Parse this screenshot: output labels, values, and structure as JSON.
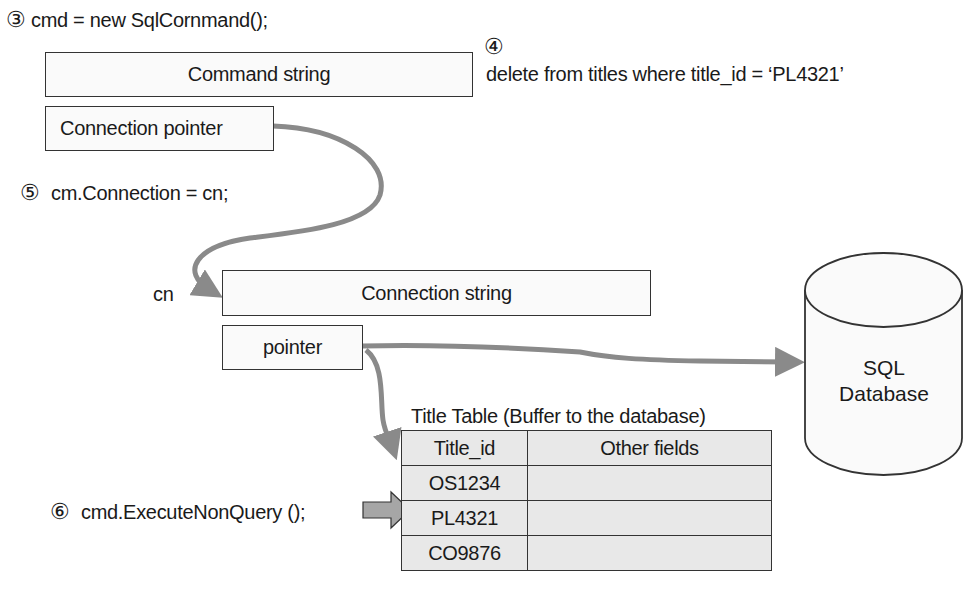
{
  "steps": {
    "step3": {
      "number": "③",
      "code": "cmd = new SqlCornmand();"
    },
    "step4": {
      "number": "④",
      "sql": "delete from titles where title_id = ‘PL4321’"
    },
    "step5": {
      "number": "⑤",
      "code": "cm.Connection = cn;"
    },
    "step6": {
      "number": "⑥",
      "code": "cmd.ExecuteNonQuery ();"
    }
  },
  "command_object": {
    "command_string_label": "Command string",
    "connection_pointer_label": "Connection pointer"
  },
  "connection_object": {
    "variable_label": "cn",
    "connection_string_label": "Connection string",
    "pointer_label": "pointer"
  },
  "database": {
    "line1": "SQL",
    "line2": "Database"
  },
  "title_table": {
    "caption": "Title Table (Buffer to the database)",
    "columns": [
      "Title_id",
      "Other fields"
    ],
    "rows": [
      {
        "title_id": "OS1234",
        "other": ""
      },
      {
        "title_id": "PL4321",
        "other": ""
      },
      {
        "title_id": "CO9876",
        "other": ""
      }
    ],
    "highlighted_row": "PL4321"
  },
  "colors": {
    "arrow": "#8a8a8a",
    "table_fill": "#e8e8e8",
    "border": "#333333"
  }
}
